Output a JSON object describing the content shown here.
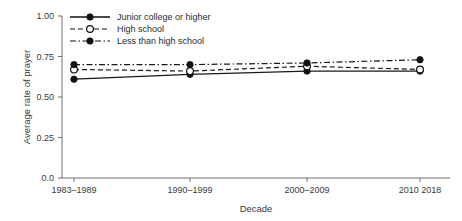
{
  "chart_data": {
    "type": "line",
    "title": "",
    "xlabel": "Decade",
    "ylabel": "Average rate of prayer",
    "categories": [
      "1983-1989",
      "1990-1999",
      "2000-2009",
      "2010 2018"
    ],
    "xtick_labels": [
      "1983–1989",
      "1990–1999",
      "2000–2009",
      "2010  2018"
    ],
    "ytick_labels": [
      "0.0",
      "0.25",
      "0.50",
      "0.75",
      "1.00"
    ],
    "ytick_values": [
      0.0,
      0.25,
      0.5,
      0.75,
      1.0
    ],
    "ylim": [
      0.0,
      1.0
    ],
    "grid": false,
    "legend_position": "top-left-inside",
    "series": [
      {
        "name": "Junior college or higher",
        "values": [
          0.61,
          0.64,
          0.66,
          0.66
        ],
        "line_style": "solid",
        "marker": "filled-circle",
        "color": "#111111"
      },
      {
        "name": "High school",
        "values": [
          0.67,
          0.66,
          0.69,
          0.67
        ],
        "line_style": "dashed",
        "marker": "open-circle",
        "color": "#111111"
      },
      {
        "name": "Less than high school",
        "values": [
          0.7,
          0.7,
          0.71,
          0.73
        ],
        "line_style": "dash-dot",
        "marker": "filled-circle",
        "color": "#111111"
      }
    ]
  },
  "legend": {
    "items": [
      {
        "label": "Junior college or higher"
      },
      {
        "label": "High school"
      },
      {
        "label": "Less than high school"
      }
    ]
  },
  "axes": {
    "y_title": "Average rate of prayer",
    "x_title": "Decade"
  }
}
